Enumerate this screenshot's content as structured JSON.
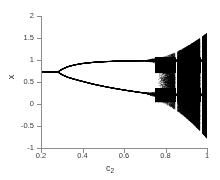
{
  "chart_data": {
    "type": "scatter",
    "title": "",
    "subtitle": "",
    "xlabel": "c_2",
    "xlabel_base": "c",
    "xlabel_sub": "2",
    "ylabel": "x",
    "xlim": [
      0.2,
      1.0
    ],
    "ylim": [
      -1.0,
      2.0
    ],
    "xticks": [
      0.2,
      0.4,
      0.6,
      0.8,
      1
    ],
    "xtick_labels": [
      "0.2",
      "0.4",
      "0.6",
      "0.8",
      "1"
    ],
    "yticks": [
      -1,
      -0.5,
      0,
      0.5,
      1,
      1.5,
      2
    ],
    "ytick_labels": [
      "-1",
      "-0.5",
      "0",
      "0.5",
      "1",
      "1.5",
      "2"
    ],
    "grid": false,
    "legend": null,
    "legend_position": "none",
    "point_color": "#000000",
    "axis_color": "#8c8c8c",
    "background": "#ffffff",
    "frame": "left-bottom-only",
    "annotations": [
      {
        "label": "stable fixed point",
        "c2_range": [
          0.2,
          0.28
        ],
        "x_value": 0.74
      },
      {
        "label": "pitchfork bifurcation",
        "c2": 0.28,
        "x_value": 0.735
      },
      {
        "label": "upper branch end",
        "c2": 0.75,
        "x_value": 0.99
      },
      {
        "label": "lower branch end",
        "c2": 0.75,
        "x_value": 0.22
      },
      {
        "label": "chaos onset",
        "c2": 0.75
      },
      {
        "label": "periodic window",
        "c2": 0.85
      },
      {
        "label": "secondary window",
        "c2": 0.97
      },
      {
        "label": "chaotic band extent at c2=1",
        "x_min": -0.78,
        "x_max": 1.62
      }
    ],
    "branches": {
      "fixed_point": {
        "name": "fixed point",
        "c2": [
          0.2,
          0.22,
          0.24,
          0.26,
          0.275,
          0.28
        ],
        "values": [
          0.742,
          0.741,
          0.74,
          0.738,
          0.736,
          0.735
        ]
      },
      "upper_branch": {
        "name": "upper branch",
        "c2": [
          0.28,
          0.3,
          0.33,
          0.36,
          0.4,
          0.45,
          0.5,
          0.55,
          0.6,
          0.65,
          0.7,
          0.73,
          0.75
        ],
        "values": [
          0.735,
          0.8,
          0.86,
          0.898,
          0.93,
          0.955,
          0.97,
          0.98,
          0.986,
          0.99,
          0.993,
          0.995,
          0.996
        ]
      },
      "lower_branch": {
        "name": "lower branch",
        "c2": [
          0.28,
          0.3,
          0.33,
          0.36,
          0.4,
          0.45,
          0.5,
          0.55,
          0.6,
          0.65,
          0.7,
          0.73,
          0.75
        ],
        "values": [
          0.735,
          0.672,
          0.612,
          0.57,
          0.52,
          0.46,
          0.41,
          0.365,
          0.325,
          0.29,
          0.255,
          0.235,
          0.22
        ]
      }
    },
    "chaotic_region": {
      "c2_start": 0.75,
      "c2_end": 1.0,
      "upper_band": {
        "x_min": 0.72,
        "x_max": 1.06
      },
      "lower_band": {
        "x_min": 0.06,
        "x_max": 0.36
      },
      "full_spread_from_c2": 0.88,
      "full_spread": {
        "x_min": -0.78,
        "x_max": 1.62
      }
    }
  }
}
